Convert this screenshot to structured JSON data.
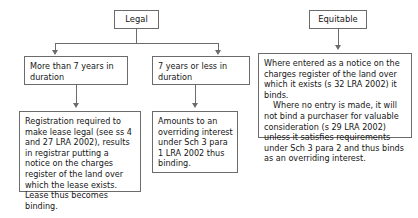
{
  "diagram": {
    "line_color": "#6b6b6b",
    "background": "#ffffff",
    "nodes": {
      "legal": "Legal",
      "equitable": "Equitable",
      "more_than_7": "More than 7 years in duration",
      "seven_or_less": "7 years or less in duration",
      "registration": "Registration required to make lease legal (see ss 4 and 27 LRA 2002), results in registrar putting a notice on the charges register of the land over which the lease exists. Lease thus becomes binding.",
      "amounts_overriding": "Amounts to an overriding interest under Sch 3 para 1 LRA 2002 thus binding.",
      "equitable_detail_para1": "Where entered as a notice on the charges register of the land over which it exists (s 32 LRA 2002) it binds.",
      "equitable_detail_para2": "Where no entry is made, it will not bind a purchaser for valuable consideration (s 29 LRA 2002) unless it satisfies requirements under Sch 3 para 2 and thus binds as an overriding interest."
    }
  }
}
